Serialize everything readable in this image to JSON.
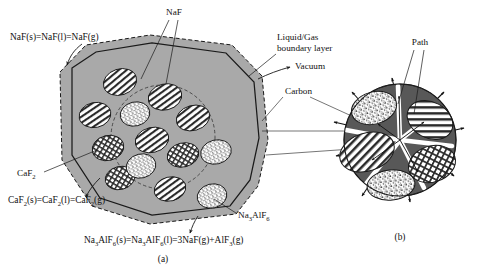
{
  "figure": {
    "panels": [
      {
        "id": "a",
        "caption": "(a)"
      },
      {
        "id": "b",
        "caption": "(b)"
      }
    ],
    "labels": {
      "naf": "NaF",
      "boundary_line1": "Liquid/Gas",
      "boundary_line2": "boundary layer",
      "vacuum": "Vacuum",
      "carbon": "Carbon",
      "caf2_main": "CaF",
      "caf2_sub": "2",
      "cryolite_main_1": "Na",
      "cryolite_sub_1": "3",
      "cryolite_main_2": "AlF",
      "cryolite_sub_2": "6",
      "path": "Path"
    },
    "equations": {
      "naf_eq": "NaF(s)=NaF(l)=NaF(g)",
      "caf2_eq_parts": [
        {
          "t": "CaF",
          "sub": false
        },
        {
          "t": "2",
          "sub": true
        },
        {
          "t": "(s)=CaF",
          "sub": false
        },
        {
          "t": "2",
          "sub": true
        },
        {
          "t": "(l)=CaF",
          "sub": false
        },
        {
          "t": "2",
          "sub": true
        },
        {
          "t": "(g)",
          "sub": false
        }
      ],
      "cryolite_eq_parts": [
        {
          "t": "Na",
          "sub": false
        },
        {
          "t": "3",
          "sub": true
        },
        {
          "t": "AlF",
          "sub": false
        },
        {
          "t": "6",
          "sub": true
        },
        {
          "t": "(s)=Na",
          "sub": false
        },
        {
          "t": "3",
          "sub": true
        },
        {
          "t": "AlF",
          "sub": false
        },
        {
          "t": "6",
          "sub": true
        },
        {
          "t": "(l)=3NaF(g)+AlF",
          "sub": false
        },
        {
          "t": "3",
          "sub": true
        },
        {
          "t": "(g)",
          "sub": false
        }
      ]
    },
    "colors": {
      "bath_gray": "#a9a9a9",
      "carbon_dark": "#585858",
      "outline": "#1a1a1a",
      "white": "#ffffff",
      "background": "#ffffff"
    },
    "phases": [
      {
        "name": "NaF",
        "pattern": "diagonal-stripes"
      },
      {
        "name": "CaF2",
        "pattern": "cross-hatch"
      },
      {
        "name": "Na3AlF6",
        "pattern": "stipple-dots"
      }
    ]
  }
}
